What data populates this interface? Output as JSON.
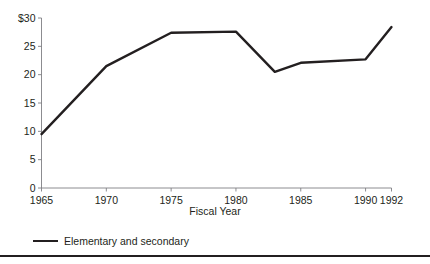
{
  "chart_data": {
    "type": "line",
    "title": "",
    "xlabel": "Fiscal Year",
    "ylabel": "",
    "x": [
      1965,
      1970,
      1975,
      1980,
      1983,
      1985,
      1990,
      1992
    ],
    "series": [
      {
        "name": "Elementary and secondary",
        "color": "#231f20",
        "values": [
          9.5,
          21.5,
          27.4,
          27.6,
          20.5,
          22.1,
          22.7,
          28.4
        ]
      }
    ],
    "xlim": [
      1965,
      1992
    ],
    "ylim": [
      0,
      30
    ],
    "xticks": [
      1965,
      1970,
      1975,
      1980,
      1985,
      1990,
      1992
    ],
    "xtick_labels": [
      "1965",
      "1970",
      "1975",
      "1980",
      "1985",
      "1990",
      "1992"
    ],
    "yticks": [
      0,
      5,
      10,
      15,
      20,
      25,
      30
    ],
    "ytick_labels": [
      "0",
      "5",
      "10",
      "15",
      "20",
      "25",
      "$30"
    ],
    "grid": false,
    "legend_position": "below-left",
    "legend_entries": [
      "Elementary and secondary"
    ]
  },
  "axes": {
    "x_title": "Fiscal Year"
  },
  "legend": {
    "entry_label": "Elementary and secondary"
  },
  "style": {
    "line_color": "#231f20",
    "axis_color": "#7f7f83",
    "text_color": "#231f20",
    "background": "#ffffff"
  }
}
